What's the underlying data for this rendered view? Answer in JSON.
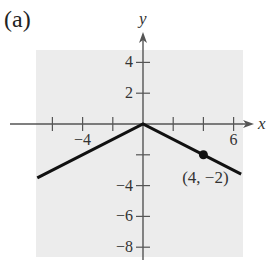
{
  "panel_label": "(a)",
  "chart_data": {
    "type": "line",
    "title": "",
    "panel": "(a)",
    "function": "y = -1/2 |x|",
    "xlabel": "x",
    "ylabel": "y",
    "xlim": [
      -7,
      6.5
    ],
    "ylim": [
      -8.5,
      5.5
    ],
    "grid": false,
    "background": "#ececec",
    "x_ticks": [
      -6,
      -4,
      -2,
      2,
      4,
      6
    ],
    "x_tick_labels": [
      {
        "value": -4,
        "label": "−4"
      },
      {
        "value": 6,
        "label": "6"
      }
    ],
    "y_ticks": [
      4,
      2,
      -2,
      -4,
      -6,
      -8
    ],
    "y_tick_labels": [
      {
        "value": 4,
        "label": "4"
      },
      {
        "value": 2,
        "label": "2"
      },
      {
        "value": -4,
        "label": "−4"
      },
      {
        "value": -6,
        "label": "−6"
      },
      {
        "value": -8,
        "label": "−8"
      }
    ],
    "series": [
      {
        "name": "y = -1/2|x|",
        "color": "#111111",
        "points": [
          {
            "x": -7,
            "y": -3.5
          },
          {
            "x": 0,
            "y": 0
          },
          {
            "x": 6.5,
            "y": -3.25
          }
        ]
      }
    ],
    "annotations": [
      {
        "type": "point",
        "x": 4,
        "y": -2,
        "label": "(4, −2)"
      }
    ]
  }
}
